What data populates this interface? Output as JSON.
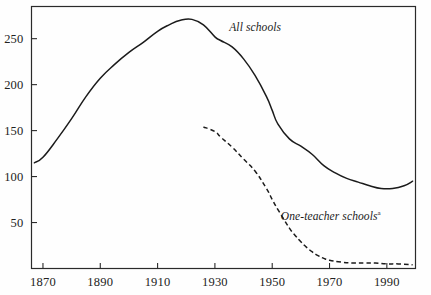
{
  "chart_data": {
    "type": "line",
    "title": "",
    "subtitle": "",
    "xlabel": "",
    "ylabel": "",
    "xlim": [
      1866,
      2000
    ],
    "ylim": [
      0,
      285
    ],
    "grid": false,
    "legend_position": "inline-annotation",
    "x_ticks": [
      1870,
      1890,
      1910,
      1930,
      1950,
      1970,
      1990
    ],
    "x_tick_labels": [
      "1870",
      "1890",
      "1910",
      "1930",
      "1950",
      "1970",
      "1990"
    ],
    "y_ticks": [
      50,
      100,
      150,
      200,
      250
    ],
    "y_tick_labels": [
      "50",
      "100",
      "150",
      "200",
      "250"
    ],
    "series": [
      {
        "name": "All schools",
        "style": "solid",
        "color": "#1b1b1b",
        "x": [
          1867,
          1870,
          1875,
          1880,
          1885,
          1890,
          1895,
          1900,
          1905,
          1910,
          1914,
          1918,
          1922,
          1926,
          1930,
          1932,
          1936,
          1940,
          1944,
          1948,
          1950,
          1952,
          1956,
          1960,
          1964,
          1968,
          1972,
          1976,
          1980,
          1984,
          1988,
          1992,
          1996,
          1999
        ],
        "y": [
          115,
          121,
          141,
          163,
          187,
          207,
          222,
          235,
          246,
          258,
          265,
          270,
          271,
          265,
          252,
          248,
          241,
          228,
          210,
          187,
          172,
          157,
          141,
          133,
          124,
          112,
          104,
          98,
          94,
          90,
          87,
          87,
          90,
          95
        ]
      },
      {
        "name": "One-teacher schools",
        "note_marker": "a",
        "style": "dashed",
        "color": "#1b1b1b",
        "x": [
          1926,
          1930,
          1932,
          1936,
          1940,
          1944,
          1948,
          1950,
          1952,
          1956,
          1958,
          1960,
          1962,
          1964,
          1966,
          1968,
          1970,
          1974,
          1978,
          1982,
          1986,
          1990,
          1994,
          1999
        ],
        "y": [
          154,
          149,
          143,
          132,
          119,
          106,
          87,
          75,
          64,
          44,
          36,
          29,
          23,
          18,
          14,
          11,
          9,
          7,
          6,
          6,
          6,
          5,
          5,
          4
        ]
      }
    ],
    "annotations": [
      {
        "id": "all-schools",
        "text": "All schools",
        "x_year": 1935,
        "y_value": 262
      },
      {
        "id": "one-teacher-schools",
        "text": "One-teacher schools",
        "marker": "a",
        "x_year": 1953,
        "y_value": 57
      }
    ]
  },
  "axes": {
    "frame_color": "#2a2a2a",
    "tick_color": "#2a2a2a"
  }
}
